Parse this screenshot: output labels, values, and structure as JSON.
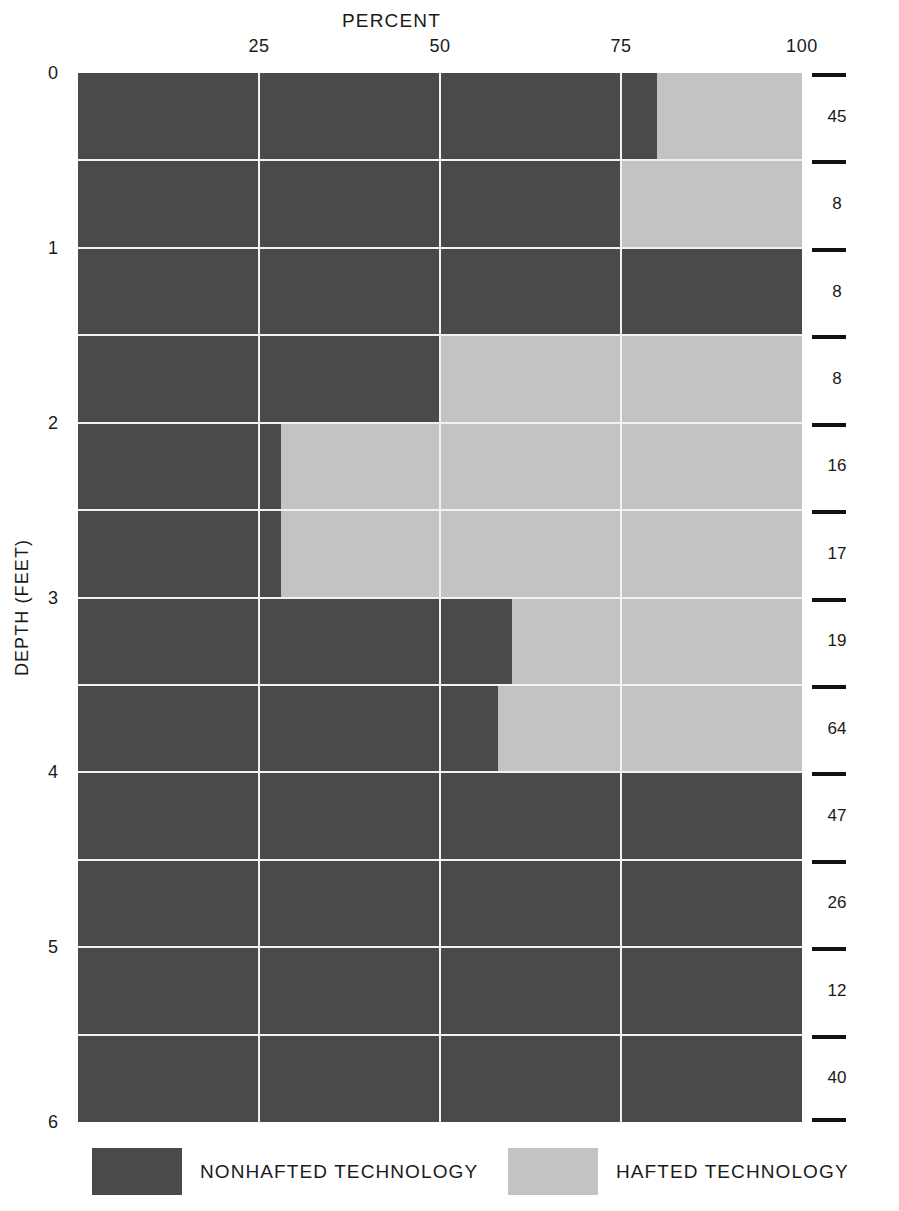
{
  "chart_data": {
    "type": "bar",
    "orientation": "horizontal-stacked",
    "title": "PERCENT",
    "xlabel": "PERCENT",
    "ylabel": "DEPTH (FEET)",
    "right_axis_label": "CLASSIFIABLE STONE ARTIFACTS (TOTAL NUMBERS PER LEVEL)",
    "xlim": [
      0,
      100
    ],
    "xticks": [
      25,
      50,
      75,
      100
    ],
    "xtick_labels": [
      "25",
      "50",
      "75",
      "100"
    ],
    "ylim": [
      0,
      6
    ],
    "yticks": [
      0,
      1,
      2,
      3,
      4,
      5,
      6
    ],
    "ytick_labels": [
      "0",
      "1",
      "2",
      "3",
      "4",
      "5",
      "6"
    ],
    "grid": true,
    "legend_position": "bottom",
    "categories": [
      "0.0-0.5",
      "0.5-1.0",
      "1.0-1.5",
      "1.5-2.0",
      "2.0-2.5",
      "2.5-3.0",
      "3.0-3.5",
      "3.5-4.0",
      "4.0-4.5",
      "4.5-5.0",
      "5.0-5.5",
      "5.5-6.0"
    ],
    "series": [
      {
        "name": "NONHAFTED TECHNOLOGY",
        "color": "#4a4a4a",
        "values": [
          80,
          75,
          100,
          50,
          28,
          28,
          60,
          58,
          100,
          100,
          100,
          100
        ]
      },
      {
        "name": "HAFTED TECHNOLOGY",
        "color": "#c3c3c3",
        "values": [
          20,
          25,
          0,
          50,
          72,
          72,
          40,
          42,
          0,
          0,
          0,
          0
        ]
      }
    ],
    "level_counts": [
      45,
      8,
      8,
      8,
      16,
      17,
      19,
      64,
      47,
      26,
      12,
      40
    ]
  },
  "legend": {
    "items": [
      {
        "label": "NONHAFTED TECHNOLOGY",
        "color": "#4a4a4a"
      },
      {
        "label": "HAFTED TECHNOLOGY",
        "color": "#c3c3c3"
      }
    ]
  }
}
